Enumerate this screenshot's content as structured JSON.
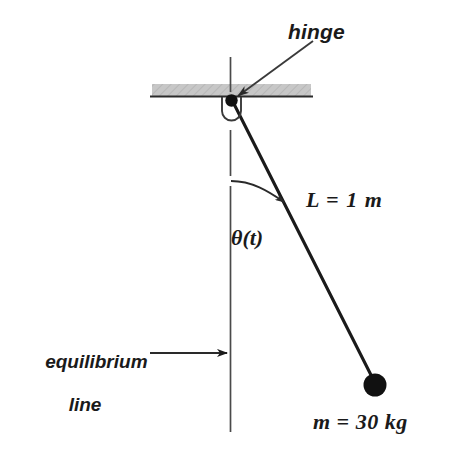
{
  "figure": {
    "background_color": "#ffffff",
    "ink_color": "#1a1a1a",
    "ceiling_color": "#bcbcbc"
  },
  "labels": {
    "hinge": "hinge",
    "length": "L = 1 m",
    "angle": "θ(t)",
    "equilibrium_line_1": "equilibrium",
    "equilibrium_line_2": "line",
    "mass": "m = 30 kg"
  },
  "values": {
    "length_symbol": "L",
    "length_value": "1",
    "length_unit": "m",
    "mass_symbol": "m",
    "mass_value": "30",
    "mass_unit": "kg",
    "angle_symbol": "θ(t)"
  },
  "geometry": {
    "hinge_x": 231,
    "hinge_y": 101,
    "bob_x": 375,
    "bob_y": 385,
    "bob_radius": 11,
    "rod_angle_deg_from_vertical": 27,
    "ceiling_left": 152,
    "ceiling_right": 311,
    "ceiling_top": 84,
    "ceiling_bottom": 97,
    "equilibrium_line_x": 230,
    "equilibrium_line_top": 57,
    "equilibrium_line_bottom": 432
  },
  "icons": {
    "hinge_pivot": "pivot-dot-icon",
    "hinge_bracket": "hinge-bracket-icon",
    "ceiling": "hatched-ceiling-icon",
    "bob": "pendulum-bob-icon",
    "angle_arc": "angle-arc-arrow-icon",
    "hinge_leader": "leader-arrow-icon",
    "equilibrium_leader": "leader-arrow-icon"
  }
}
